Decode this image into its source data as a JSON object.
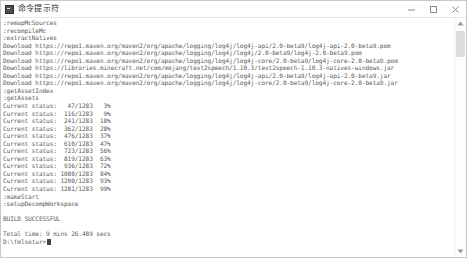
{
  "window": {
    "title": "命令提示符",
    "icon": "console-icon",
    "controls": [
      {
        "name": "minimize-button",
        "glyph": "minimize-icon"
      },
      {
        "name": "maximize-button",
        "glyph": "maximize-icon"
      },
      {
        "name": "close-button",
        "glyph": "close-icon"
      }
    ]
  },
  "console": {
    "lines": [
      ":remapMcSources",
      ":recompileMc",
      ":extractNatives",
      "Download https://repo1.maven.org/maven2/org/apache/logging/log4j/log4j-api/2.0-beta9/log4j-api-2.0-beta9.pom",
      "Download https://repo1.maven.org/maven2/org/apache/logging/log4j/log4j/2.0-beta9/log4j-2.0-beta9.pom",
      "Download https://repo1.maven.org/maven2/org/apache/logging/log4j/log4j-core/2.0-beta9/log4j-core-2.0-beta9.pom",
      "Download https://libraries.minecraft.net/com/mojang/text2speech/1.10.3/text2speech-1.10.3-natives-windows.jar",
      "Download https://repo1.maven.org/maven2/org/apache/logging/log4j/log4j-api/2.0-beta9/log4j-api-2.0-beta9.jar",
      "Download https://repo1.maven.org/maven2/org/apache/logging/log4j/log4j-core/2.0-beta9/log4j-core-2.0-beta9.jar",
      ":getAssetIndex",
      ":getAssets",
      "Current status:   47/1283   3%",
      "Current status:  116/1283   9%",
      "Current status:  241/1283  18%",
      "Current status:  362/1283  28%",
      "Current status:  476/1283  37%",
      "Current status:  610/1283  47%",
      "Current status:  723/1283  56%",
      "Current status:  819/1283  63%",
      "Current status:  936/1283  72%",
      "Current status: 1080/1283  84%",
      "Current status: 1200/1283  93%",
      "Current status: 1281/1283  99%",
      ":makeStart",
      ":setupDecompWorkspace",
      "",
      "BUILD SUCCESSFUL",
      "",
      "Total time: 9 mins 26.489 secs"
    ],
    "prompt": "D:\\fmlsotur>",
    "build_status": "BUILD SUCCESSFUL",
    "total_time": "9 mins 26.489 secs",
    "progress": {
      "total": 1283,
      "samples": [
        {
          "done": 47,
          "percent": 3
        },
        {
          "done": 116,
          "percent": 9
        },
        {
          "done": 241,
          "percent": 18
        },
        {
          "done": 362,
          "percent": 28
        },
        {
          "done": 476,
          "percent": 37
        },
        {
          "done": 610,
          "percent": 47
        },
        {
          "done": 723,
          "percent": 56
        },
        {
          "done": 819,
          "percent": 63
        },
        {
          "done": 936,
          "percent": 72
        },
        {
          "done": 1080,
          "percent": 84
        },
        {
          "done": 1200,
          "percent": 93
        },
        {
          "done": 1281,
          "percent": 99
        }
      ]
    }
  },
  "scrollbar": {
    "up_arrow": "scroll-up-icon",
    "down_arrow": "scroll-down-icon"
  },
  "colors": {
    "background": "#ffffff",
    "text": "#5a5a5a",
    "border": "#c8c8c8",
    "thumb": "#dcdcdc"
  }
}
